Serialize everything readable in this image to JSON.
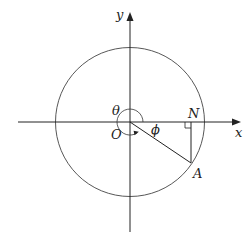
{
  "diagram": {
    "type": "unit-circle-geometry",
    "labels": {
      "x_axis": "x",
      "y_axis": "y",
      "origin": "O",
      "theta": "θ",
      "phi": "ϕ",
      "point_n": "N",
      "point_a": "A"
    },
    "elements": [
      "circle centered at O",
      "x-axis with arrow",
      "y-axis with arrow",
      "radius OA in fourth quadrant",
      "perpendicular AN to x-axis with right-angle marker",
      "reflex angle θ arc around O",
      "angle ϕ between x-axis and OA"
    ],
    "colors": {
      "stroke": "#333333",
      "background": "#ffffff"
    }
  }
}
